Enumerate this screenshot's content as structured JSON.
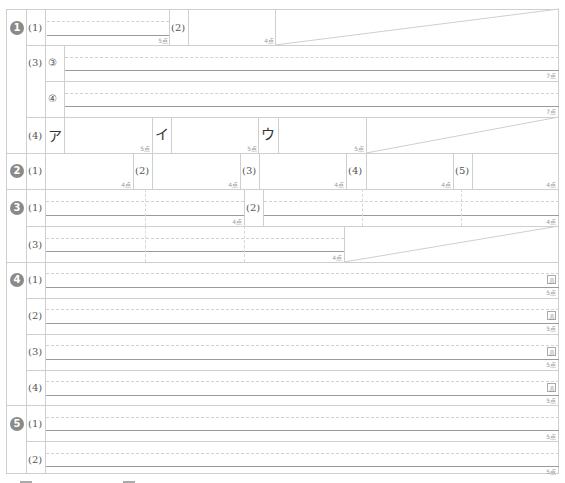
{
  "sections": [
    {
      "badge": "1",
      "label": "❶"
    },
    {
      "badge": "2",
      "label": "❷"
    },
    {
      "badge": "3",
      "label": "❸"
    },
    {
      "badge": "4",
      "label": "❹"
    },
    {
      "badge": "5",
      "label": "❺"
    }
  ],
  "s1": {
    "q1": "(1)",
    "q1_points": "5点",
    "q2": "(2)",
    "q2_points": "4点",
    "q3": "(3)",
    "q3_sub1": "③",
    "q3_sub1_points": "7点",
    "q3_sub2": "④",
    "q3_sub2_points": "7点",
    "q4": "(4)",
    "q4_a": "ア",
    "q4_a_points": "5点",
    "q4_i": "イ",
    "q4_i_points": "5点",
    "q4_u": "ウ",
    "q4_u_points": "5点"
  },
  "s2": {
    "q1": "(1)",
    "q1_points": "4点",
    "q2": "(2)",
    "q2_points": "4点",
    "q3": "(3)",
    "q3_points": "4点",
    "q4": "(4)",
    "q4_points": "4点",
    "q5": "(5)",
    "q5_points": "4点"
  },
  "s3": {
    "q1": "(1)",
    "q1_points": "4点",
    "q2": "(2)",
    "q2_points": "4点",
    "q3": "(3)",
    "q3_points": "4点"
  },
  "s4": {
    "q1": "(1)",
    "q1_points": "5点",
    "q1_mark": "表",
    "q2": "(2)",
    "q2_points": "5点",
    "q2_mark": "表",
    "q3": "(3)",
    "q3_points": "5点",
    "q3_mark": "表",
    "q4": "(4)",
    "q4_points": "5点",
    "q4_mark": "表"
  },
  "s5": {
    "q1": "(1)",
    "q1_points": "5点",
    "q2": "(2)",
    "q2_points": "5点"
  }
}
